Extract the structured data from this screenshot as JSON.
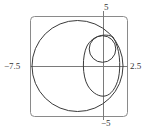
{
  "figure": {
    "type": "polar-curves-plot",
    "window": {
      "xmin": -7.5,
      "xmax": 2.5,
      "ymin": -5,
      "ymax": 5
    },
    "labels": {
      "ymax": "5",
      "ymin": "−5",
      "xmin": "−7.5",
      "xmax": "2.5"
    },
    "curves": [
      {
        "name": "large-circle"
      },
      {
        "name": "small-circle"
      },
      {
        "name": "oval-loop"
      }
    ],
    "colors": {
      "stroke": "#3a3a3a",
      "axis": "#7a7a7a",
      "frame": "#8a8a8a"
    }
  }
}
